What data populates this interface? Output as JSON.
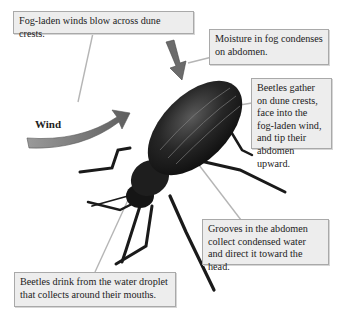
{
  "diagram": {
    "labels": {
      "wind": "Wind"
    },
    "callouts": [
      {
        "id": "fog-winds",
        "text": "Fog-laden winds blow across dune crests."
      },
      {
        "id": "moisture",
        "text": "Moisture in fog condenses on abdomen."
      },
      {
        "id": "beetles-gather",
        "text": "Beetles gather on dune crests, face into the fog-laden wind, and tip their abdomen upward."
      },
      {
        "id": "grooves",
        "text": "Grooves in the abdomen collect condensed water and direct it toward the head."
      },
      {
        "id": "drink",
        "text": "Beetles drink from the water droplet that collects around their mouths."
      }
    ],
    "colors": {
      "callout_bg": "#ededed",
      "callout_border": "#a9a9a9",
      "arrow": "#6f6f6f",
      "beetle": "#1c1c1c"
    }
  }
}
